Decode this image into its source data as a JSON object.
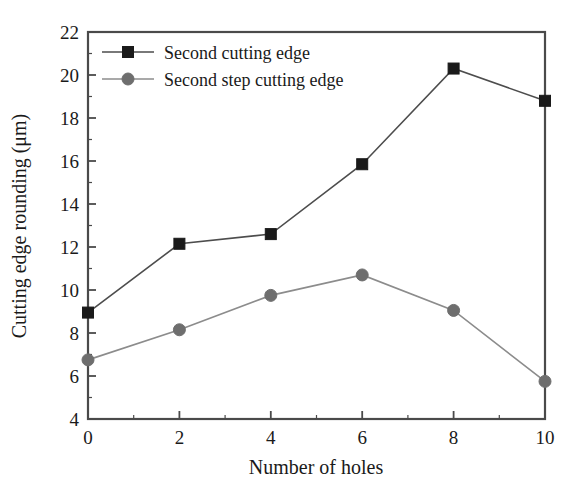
{
  "chart_data": {
    "type": "line",
    "title": "",
    "subtitle": "",
    "xlabel": "Number of holes",
    "ylabel": "Cutting edge rounding (μm)",
    "x": [
      0,
      2,
      4,
      6,
      8,
      10
    ],
    "xlim": [
      0,
      10
    ],
    "ylim": [
      4,
      22
    ],
    "xticks": [
      "0",
      "2",
      "4",
      "6",
      "8",
      "10"
    ],
    "yticks": [
      "4",
      "6",
      "8",
      "10",
      "12",
      "14",
      "16",
      "18",
      "20",
      "22"
    ],
    "xtick_step": 2,
    "ytick_step": 2,
    "minor_ticks": true,
    "grid": false,
    "legend_position": "top-left",
    "series": [
      {
        "name": "Second cutting edge",
        "marker": "square",
        "color": "#1a1a1a",
        "line_color": "#4d4d4d",
        "values": [
          8.95,
          12.15,
          12.6,
          15.85,
          20.3,
          18.8
        ]
      },
      {
        "name": "Second step cutting edge",
        "marker": "circle",
        "color": "#6e6e6e",
        "line_color": "#8c8c8c",
        "values": [
          6.75,
          8.15,
          9.75,
          10.7,
          9.05,
          5.75
        ]
      }
    ]
  },
  "axes": {
    "x_title": "Number of holes",
    "y_title": "Cutting edge rounding (μm)"
  },
  "legend": {
    "entries": [
      {
        "label": "Second cutting edge"
      },
      {
        "label": "Second step cutting edge"
      }
    ]
  },
  "ticklabels": {
    "x": [
      "0",
      "2",
      "4",
      "6",
      "8",
      "10"
    ],
    "y": [
      "4",
      "6",
      "8",
      "10",
      "12",
      "14",
      "16",
      "18",
      "20",
      "22"
    ]
  },
  "colors": {
    "frame": "#4a4a4a",
    "series1": "#1a1a1a",
    "series2": "#6e6e6e",
    "background": "#ffffff",
    "text": "#1a1a1a"
  }
}
